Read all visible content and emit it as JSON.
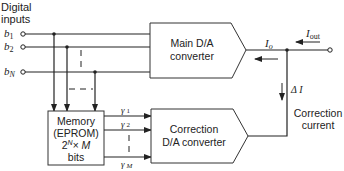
{
  "diagram": {
    "title": "",
    "inputs": {
      "heading_line1": "Digital",
      "heading_line2": "inputs",
      "bits": [
        {
          "label": "b",
          "sub": "1"
        },
        {
          "label": "b",
          "sub": "2"
        },
        {
          "label": "b",
          "sub": "N"
        }
      ]
    },
    "main_dac": {
      "line1": "Main D/A",
      "line2": "converter"
    },
    "memory": {
      "line1": "Memory",
      "line2": "(EPROM)",
      "line3_base": "2",
      "line3_sup": "N",
      "line3_rest": "× M",
      "line4": "bits"
    },
    "correction_dac": {
      "line1": "Correction",
      "line2": "D/A converter"
    },
    "gamma_lines": [
      {
        "label": "γ",
        "sub": "1"
      },
      {
        "label": "γ",
        "sub": "2"
      },
      {
        "label": "γ",
        "sub": "M"
      }
    ],
    "currents": {
      "io_label": "I",
      "io_sub": "o",
      "iout_label": "I",
      "iout_sub": "out",
      "delta_label": "Δ I"
    },
    "correction_current": {
      "line1": "Correction",
      "line2": "current"
    },
    "colors": {
      "line": "#222222",
      "background": "#ffffff"
    }
  }
}
